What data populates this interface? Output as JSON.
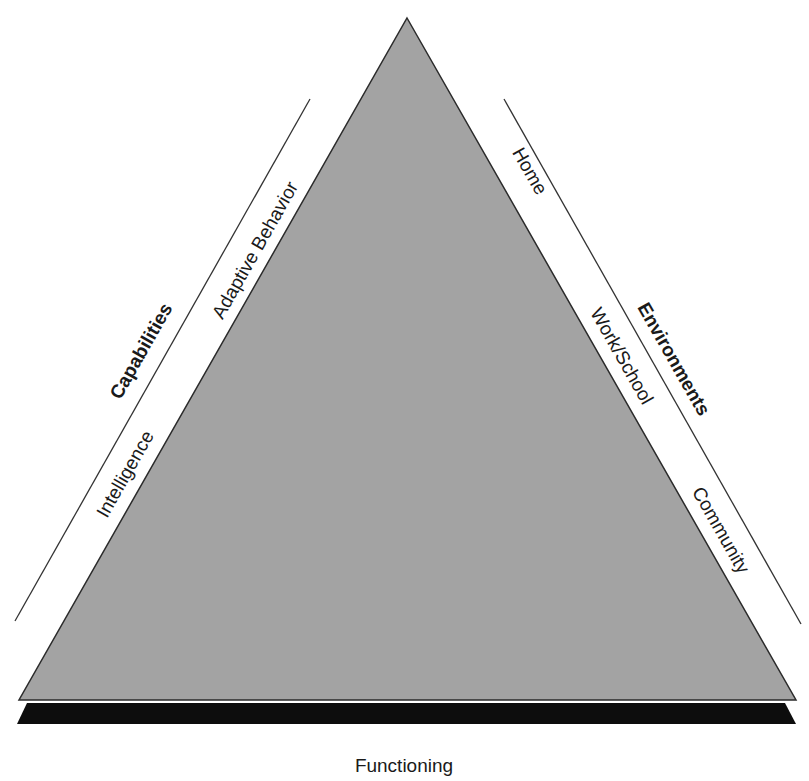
{
  "diagram": {
    "type": "triangle-model",
    "colors": {
      "triangle_fill": "#a3a3a3",
      "triangle_stroke": "#2b2b2b",
      "base_fill": "#0d0d0d",
      "guide_line": "#333333",
      "text": "#1a1a1a",
      "background": "#ffffff"
    },
    "left_side": {
      "group_label": "Capabilities",
      "items": [
        "Adaptive Behavior",
        "Intelligence"
      ]
    },
    "right_side": {
      "group_label": "Environments",
      "items": [
        "Home",
        "Work/School",
        "Community"
      ]
    },
    "base": {
      "label": "Functioning"
    }
  }
}
